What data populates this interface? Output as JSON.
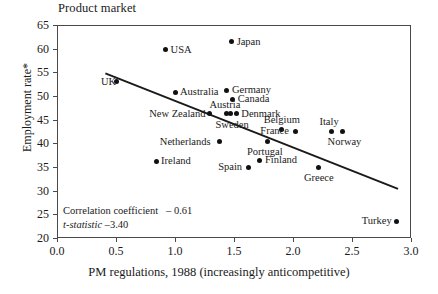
{
  "chart_data": {
    "type": "scatter",
    "title": "Product market",
    "xlabel": "PM regulations, 1988 (increasingly anticompetitive)",
    "ylabel": "Employment rate*",
    "xlim": [
      0.0,
      3.0
    ],
    "ylim": [
      20,
      65
    ],
    "xticks": [
      "0.0",
      "0.5",
      "1.0",
      "1.5",
      "2.0",
      "2.5",
      "3.0"
    ],
    "xtick_values": [
      0.0,
      0.5,
      1.0,
      1.5,
      2.0,
      2.5,
      3.0
    ],
    "yticks": [
      "20",
      "25",
      "30",
      "35",
      "40",
      "45",
      "50",
      "55",
      "60",
      "65"
    ],
    "ytick_values": [
      20,
      25,
      30,
      35,
      40,
      45,
      50,
      55,
      60,
      65
    ],
    "grid": false,
    "legend": false,
    "points": [
      {
        "label": "UK",
        "x": 0.5,
        "y": 53.0,
        "label_pos": "left"
      },
      {
        "label": "USA",
        "x": 0.92,
        "y": 59.8,
        "label_pos": "right"
      },
      {
        "label": "Japan",
        "x": 1.48,
        "y": 61.5,
        "label_pos": "right"
      },
      {
        "label": "Australia",
        "x": 1.0,
        "y": 50.8,
        "label_pos": "right"
      },
      {
        "label": "Germany",
        "x": 1.44,
        "y": 51.2,
        "label_pos": "right"
      },
      {
        "label": "Canada",
        "x": 1.49,
        "y": 49.3,
        "label_pos": "right"
      },
      {
        "label": "New Zealand",
        "x": 1.29,
        "y": 46.3,
        "label_pos": "left"
      },
      {
        "label": "Austria",
        "x": 1.44,
        "y": 46.2,
        "label_pos": "above"
      },
      {
        "label": "Sweden",
        "x": 1.47,
        "y": 46.2,
        "label_pos": "below"
      },
      {
        "label": "Denmark",
        "x": 1.52,
        "y": 46.3,
        "label_pos": "right"
      },
      {
        "label": "Belgium",
        "x": 1.9,
        "y": 43.0,
        "label_pos": "above"
      },
      {
        "label": "France",
        "x": 2.02,
        "y": 42.6,
        "label_pos": "left"
      },
      {
        "label": "Italy",
        "x": 2.33,
        "y": 42.6,
        "label_pos": "above"
      },
      {
        "label": "Norway",
        "x": 2.42,
        "y": 42.6,
        "label_pos": "below"
      },
      {
        "label": "Netherlands",
        "x": 1.38,
        "y": 40.3,
        "label_pos": "left"
      },
      {
        "label": "Portugal",
        "x": 1.78,
        "y": 40.4,
        "label_pos": "below"
      },
      {
        "label": "Ireland",
        "x": 0.84,
        "y": 36.2,
        "label_pos": "right"
      },
      {
        "label": "Spain",
        "x": 1.62,
        "y": 35.0,
        "label_pos": "left"
      },
      {
        "label": "Finland",
        "x": 1.72,
        "y": 36.4,
        "label_pos": "right"
      },
      {
        "label": "Greece",
        "x": 2.22,
        "y": 34.9,
        "label_pos": "below"
      },
      {
        "label": "Turkey",
        "x": 2.88,
        "y": 23.5,
        "label_pos": "left"
      }
    ],
    "trendline": {
      "x_start": 0.41,
      "y_start": 54.8,
      "x_end": 2.89,
      "y_end": 30.4
    },
    "annotations": {
      "correlation_label": "Correlation coefficient",
      "correlation_value": "– 0.61",
      "tstatistic_label": "t-statistic",
      "tstatistic_value": "–3.40"
    }
  },
  "colors": {
    "point": "#111111",
    "axis": "#4a4a4a",
    "trendline": "#1a1a1a",
    "background": "#ffffff"
  }
}
